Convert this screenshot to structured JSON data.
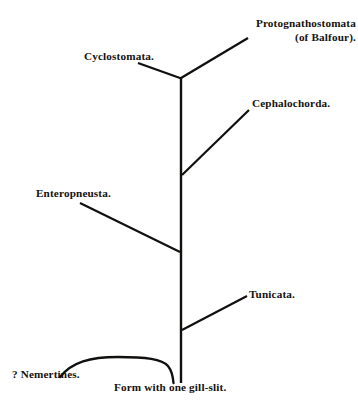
{
  "diagram": {
    "background_color": "#ffffff",
    "line_color": "#12100e",
    "labels": {
      "protognathostomata_line1": "Protognathostomata",
      "protognathostomata_line2": "(of Balfour).",
      "cyclostomata": "Cyclostomata.",
      "cephalochorda": "Cephalochorda.",
      "enteropneusta": "Enteropneusta.",
      "tunicata": "Tunicata.",
      "nemertines": "? Nemertines.",
      "form_gill_slit": "Form with one gill-slit."
    },
    "nodes": [
      {
        "name": "form-with-one-gill-slit",
        "label": "Form with one gill-slit.",
        "x": 181,
        "y": 382,
        "role": "root"
      },
      {
        "name": "tunicata-junction",
        "x": 181,
        "y": 330,
        "role": "branch-point"
      },
      {
        "name": "enteropneusta-junction",
        "x": 181,
        "y": 252,
        "role": "branch-point"
      },
      {
        "name": "cephalochorda-junction",
        "x": 181,
        "y": 175,
        "role": "branch-point"
      },
      {
        "name": "apex-junction",
        "x": 181,
        "y": 77,
        "role": "branch-point"
      },
      {
        "name": "protognathostomata-tip",
        "label": "Protognathostomata (of Balfour).",
        "x": 248,
        "y": 38,
        "role": "terminal"
      },
      {
        "name": "cyclostomata-tip",
        "label": "Cyclostomata.",
        "x": 138,
        "y": 63,
        "role": "terminal"
      },
      {
        "name": "cephalochorda-tip",
        "label": "Cephalochorda.",
        "x": 249,
        "y": 110,
        "role": "terminal"
      },
      {
        "name": "enteropneusta-tip",
        "label": "Enteropneusta.",
        "x": 80,
        "y": 203,
        "role": "terminal"
      },
      {
        "name": "tunicata-tip",
        "label": "Tunicata.",
        "x": 247,
        "y": 296,
        "role": "terminal"
      },
      {
        "name": "nemertines-tip",
        "label": "? Nemertines.",
        "x": 60,
        "y": 377,
        "role": "terminal"
      }
    ],
    "branches": [
      {
        "name": "trunk",
        "from": "form-with-one-gill-slit",
        "to": "apex-junction",
        "style": "straight"
      },
      {
        "name": "protognathostomata-branch",
        "from": "apex-junction",
        "to": "protognathostomata-tip",
        "style": "straight"
      },
      {
        "name": "cyclostomata-branch",
        "from": "apex-junction",
        "to": "cyclostomata-tip",
        "style": "straight"
      },
      {
        "name": "cephalochorda-branch",
        "from": "cephalochorda-junction",
        "to": "cephalochorda-tip",
        "style": "straight"
      },
      {
        "name": "enteropneusta-branch",
        "from": "enteropneusta-junction",
        "to": "enteropneusta-tip",
        "style": "straight"
      },
      {
        "name": "tunicata-branch",
        "from": "tunicata-junction",
        "to": "tunicata-tip",
        "style": "straight"
      },
      {
        "name": "nemertines-branch",
        "from": "form-with-one-gill-slit",
        "to": "nemertines-tip",
        "style": "curved-arc"
      }
    ]
  }
}
